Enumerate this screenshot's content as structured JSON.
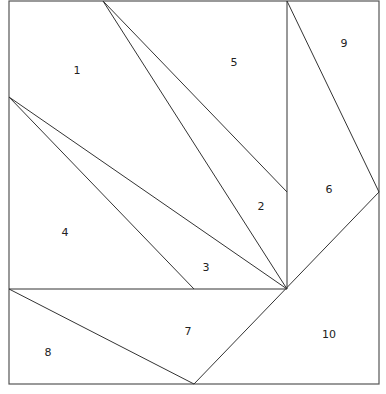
{
  "diagram": {
    "type": "geometric-dissection",
    "frame": {
      "x1": 9,
      "y1": 1,
      "x2": 379,
      "y2": 384
    },
    "vertices": {
      "top": [
        103,
        1
      ],
      "center": [
        287,
        289
      ],
      "left": [
        9,
        97
      ],
      "right": [
        379,
        192
      ],
      "vtop": [
        287,
        1
      ],
      "vmid": [
        287,
        192
      ],
      "hmid": [
        194,
        289
      ],
      "hleft": [
        9,
        289
      ],
      "bottom": [
        194,
        384
      ]
    },
    "lines": [
      {
        "from": [
          103,
          1
        ],
        "to": [
          287,
          289
        ]
      },
      {
        "from": [
          103,
          1
        ],
        "to": [
          287,
          192
        ]
      },
      {
        "from": [
          9,
          97
        ],
        "to": [
          287,
          289
        ]
      },
      {
        "from": [
          9,
          97
        ],
        "to": [
          194,
          289
        ]
      },
      {
        "from": [
          287,
          1
        ],
        "to": [
          287,
          289
        ]
      },
      {
        "from": [
          287,
          1
        ],
        "to": [
          379,
          192
        ]
      },
      {
        "from": [
          379,
          192
        ],
        "to": [
          194,
          384
        ]
      },
      {
        "from": [
          9,
          289
        ],
        "to": [
          287,
          289
        ]
      },
      {
        "from": [
          9,
          289
        ],
        "to": [
          194,
          384
        ]
      }
    ],
    "labels": [
      {
        "text": "1",
        "x": 77,
        "y": 74
      },
      {
        "text": "2",
        "x": 261,
        "y": 210
      },
      {
        "text": "3",
        "x": 206,
        "y": 271
      },
      {
        "text": "4",
        "x": 65,
        "y": 236
      },
      {
        "text": "5",
        "x": 234,
        "y": 66
      },
      {
        "text": "6",
        "x": 329,
        "y": 193
      },
      {
        "text": "7",
        "x": 188,
        "y": 335
      },
      {
        "text": "8",
        "x": 48,
        "y": 356
      },
      {
        "text": "9",
        "x": 344,
        "y": 47
      },
      {
        "text": "10",
        "x": 329,
        "y": 338
      }
    ]
  }
}
